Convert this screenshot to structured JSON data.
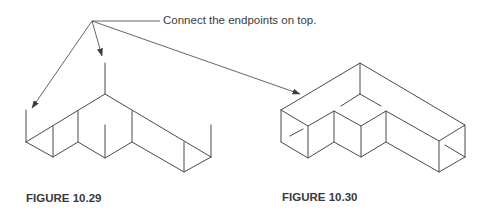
{
  "callout": {
    "text": "Connect the endpoints on top.",
    "arrow_count": 3
  },
  "figures": [
    {
      "label": "FIGURE 10.29",
      "description": "Isometric L-shaped block outline with vertical edges drawn at endpoints (top not yet connected)"
    },
    {
      "label": "FIGURE 10.30",
      "description": "Completed isometric L-shaped block with top edges connected"
    }
  ],
  "colors": {
    "line": "#4a4a4a",
    "text": "#3a3a3a",
    "background": "#ffffff"
  }
}
